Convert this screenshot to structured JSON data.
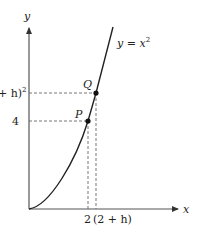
{
  "diagram": {
    "axes": {
      "x_label": "x",
      "y_label": "y"
    },
    "curve": {
      "equation_label": "y = x²",
      "eq_lhs": "y = x",
      "eq_exp": "2"
    },
    "points": [
      {
        "name": "P",
        "label": "P",
        "x_value": "2",
        "y_value": "4"
      },
      {
        "name": "Q",
        "label": "Q",
        "x_value": "(2 + h)",
        "y_value": "(2 + h)²"
      }
    ],
    "tick_labels": {
      "x_p": "2",
      "x_q": "(2 + h)",
      "y_p": "4",
      "y_q_base": "+ h)",
      "y_q_exp": "2"
    },
    "colors": {
      "axis": "#555555",
      "curve": "#222222",
      "guide": "#666666",
      "text": "#222222"
    }
  }
}
